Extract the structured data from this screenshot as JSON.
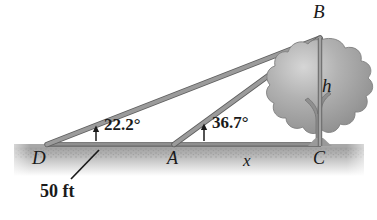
{
  "figure": {
    "labels": {
      "point_d": "D",
      "point_a": "A",
      "point_c": "C",
      "point_b": "B",
      "height": "h",
      "distance_x": "x",
      "angle_at_d": "22.2°",
      "angle_at_a": "36.7°",
      "baseline_length": "50 ft"
    },
    "colors": {
      "line": "#8a8a8a",
      "line_edge": "#5d5d5d",
      "ground": "#b9b9b9",
      "ground_dark": "#9a9a9a",
      "tree_crown": "#9d9d9d",
      "tree_crown_light": "#cfcfcf",
      "trunk": "#8f8f8f",
      "text": "#1a1a1a",
      "background": "#ffffff"
    },
    "geometry": {
      "point_d": [
        47,
        146
      ],
      "point_a": [
        174,
        146
      ],
      "point_c": [
        320,
        146
      ],
      "point_b": [
        320,
        38
      ]
    }
  }
}
